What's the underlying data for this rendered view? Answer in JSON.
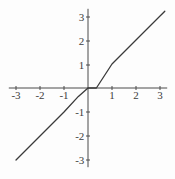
{
  "chart_data": {
    "type": "line",
    "title": "",
    "subtitle": "",
    "xlabel": "",
    "ylabel": "",
    "xlim": [
      -3.3,
      3.3
    ],
    "ylim": [
      -3.3,
      3.3
    ],
    "grid": false,
    "legend": null,
    "axis_style": "cross-at-origin",
    "x_ticks": [
      -3,
      -2,
      -1,
      1,
      2,
      3
    ],
    "y_ticks": [
      3,
      2,
      1,
      -1,
      -2,
      -3
    ],
    "x_tick_labels": [
      "-3",
      "-2",
      "-1",
      "1",
      "2",
      "3"
    ],
    "y_tick_labels": [
      "3",
      "2",
      "1",
      "-1",
      "-2",
      "-3"
    ],
    "series": [
      {
        "name": "y = x",
        "equation": "y = x",
        "color": "#3a3a3a",
        "x": [
          -3.0,
          -2.0,
          -1.0,
          -0.4,
          0.0,
          0.35,
          1.0,
          2.0,
          3.2
        ],
        "y": [
          -3.0,
          -2.0,
          -1.0,
          -0.35,
          0.0,
          0.0,
          1.0,
          2.0,
          3.2
        ]
      }
    ],
    "colors": {
      "background": "#fdfdfd",
      "axis": "#4a4a4a",
      "curve": "#3a3a3a",
      "tick_text": "#3c3c3c"
    }
  }
}
